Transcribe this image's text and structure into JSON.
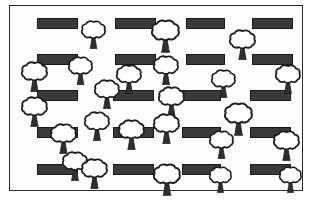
{
  "diagram": {
    "type": "site-plan",
    "frame": {
      "x": 9,
      "y": 5,
      "width": 294,
      "height": 186,
      "border_color": "#2b2b2b",
      "background_color": "#fdfdfd"
    },
    "legend": {
      "building_label": "building",
      "tree_label": "tree"
    },
    "colors": {
      "building_fill": "#3a3a3a",
      "building_stroke": "#1a1a1a",
      "tree_stroke": "#1f1f1f",
      "tree_canopy_fill": "#ffffff",
      "trunk_fill": "#2e2e2e",
      "page_background": "#ffffff"
    },
    "counts": {
      "buildings": 20,
      "trees": 24
    },
    "buildings": [
      {
        "name": "building-r1c1",
        "x": 27,
        "y": 12,
        "w": 41,
        "h": 11
      },
      {
        "name": "building-r1c2",
        "x": 105,
        "y": 12,
        "w": 41,
        "h": 11
      },
      {
        "name": "building-r1c3",
        "x": 176,
        "y": 12,
        "w": 39,
        "h": 11
      },
      {
        "name": "building-r1c4",
        "x": 242,
        "y": 12,
        "w": 41,
        "h": 11
      },
      {
        "name": "building-r2c1",
        "x": 27,
        "y": 48,
        "w": 41,
        "h": 11
      },
      {
        "name": "building-r2c2",
        "x": 105,
        "y": 48,
        "w": 41,
        "h": 11
      },
      {
        "name": "building-r2c3",
        "x": 176,
        "y": 48,
        "w": 39,
        "h": 11
      },
      {
        "name": "building-r2c4",
        "x": 242,
        "y": 48,
        "w": 41,
        "h": 11
      },
      {
        "name": "building-r3c1",
        "x": 27,
        "y": 84,
        "w": 41,
        "h": 11
      },
      {
        "name": "building-r3c2",
        "x": 103,
        "y": 84,
        "w": 41,
        "h": 11
      },
      {
        "name": "building-r3c3",
        "x": 172,
        "y": 84,
        "w": 39,
        "h": 11
      },
      {
        "name": "building-r3c4",
        "x": 240,
        "y": 84,
        "w": 41,
        "h": 11
      },
      {
        "name": "building-r4c1",
        "x": 27,
        "y": 121,
        "w": 41,
        "h": 11
      },
      {
        "name": "building-r4c2",
        "x": 103,
        "y": 121,
        "w": 41,
        "h": 11
      },
      {
        "name": "building-r4c3",
        "x": 172,
        "y": 121,
        "w": 39,
        "h": 11
      },
      {
        "name": "building-r4c4",
        "x": 240,
        "y": 121,
        "w": 41,
        "h": 11
      },
      {
        "name": "building-r5c1",
        "x": 27,
        "y": 158,
        "w": 41,
        "h": 11
      },
      {
        "name": "building-r5c2",
        "x": 103,
        "y": 158,
        "w": 41,
        "h": 11
      },
      {
        "name": "building-r5c3",
        "x": 172,
        "y": 158,
        "w": 39,
        "h": 11
      },
      {
        "name": "building-r5c4",
        "x": 240,
        "y": 158,
        "w": 41,
        "h": 11
      }
    ],
    "trees": [
      {
        "name": "tree-01",
        "x": 71,
        "y": 14,
        "size": 25
      },
      {
        "name": "tree-02",
        "x": 141,
        "y": 13,
        "size": 29
      },
      {
        "name": "tree-03",
        "x": 219,
        "y": 23,
        "size": 27
      },
      {
        "name": "tree-04",
        "x": 11,
        "y": 55,
        "size": 27
      },
      {
        "name": "tree-05",
        "x": 58,
        "y": 50,
        "size": 25
      },
      {
        "name": "tree-06",
        "x": 106,
        "y": 58,
        "size": 26
      },
      {
        "name": "tree-07",
        "x": 143,
        "y": 49,
        "size": 26
      },
      {
        "name": "tree-08",
        "x": 201,
        "y": 63,
        "size": 25
      },
      {
        "name": "tree-09",
        "x": 265,
        "y": 58,
        "size": 26
      },
      {
        "name": "tree-10",
        "x": 11,
        "y": 90,
        "size": 27
      },
      {
        "name": "tree-11",
        "x": 84,
        "y": 73,
        "size": 26
      },
      {
        "name": "tree-12",
        "x": 148,
        "y": 80,
        "size": 27
      },
      {
        "name": "tree-13",
        "x": 214,
        "y": 96,
        "size": 29
      },
      {
        "name": "tree-14",
        "x": 74,
        "y": 105,
        "size": 26
      },
      {
        "name": "tree-15",
        "x": 40,
        "y": 117,
        "size": 27
      },
      {
        "name": "tree-16",
        "x": 108,
        "y": 113,
        "size": 27
      },
      {
        "name": "tree-17",
        "x": 143,
        "y": 107,
        "size": 27
      },
      {
        "name": "tree-18",
        "x": 199,
        "y": 124,
        "size": 25
      },
      {
        "name": "tree-19",
        "x": 263,
        "y": 124,
        "size": 27
      },
      {
        "name": "tree-20",
        "x": 52,
        "y": 145,
        "size": 26
      },
      {
        "name": "tree-21",
        "x": 71,
        "y": 152,
        "size": 27
      },
      {
        "name": "tree-22",
        "x": 143,
        "y": 157,
        "size": 28
      },
      {
        "name": "tree-23",
        "x": 199,
        "y": 160,
        "size": 23
      },
      {
        "name": "tree-24",
        "x": 269,
        "y": 160,
        "size": 23
      }
    ]
  }
}
